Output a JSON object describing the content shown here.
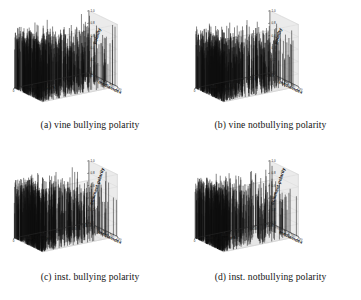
{
  "figure": {
    "panel_count": 4,
    "background": "#ffffff",
    "ink": "#111111"
  },
  "panels": [
    {
      "id": "a",
      "caption": "(a) vine bullying polarity",
      "xlabel": "hours",
      "ylabel": "mediaindex",
      "zlabel": "polarity",
      "xticks": [
        "0",
        "5000",
        "10000",
        "15000",
        "20000"
      ],
      "yticks": [
        "0",
        "25",
        "50",
        "75",
        "100"
      ],
      "zticks": [
        "0.0",
        "0.2",
        "0.4",
        "0.6",
        "0.8",
        "1.0"
      ]
    },
    {
      "id": "b",
      "caption": "(b) vine notbullying polarity",
      "xlabel": "hours",
      "ylabel": "mediaindex",
      "zlabel": "polarity",
      "xticks": [
        "0",
        "5000",
        "10000",
        "15000",
        "20000"
      ],
      "yticks": [
        "0",
        "25",
        "50",
        "75",
        "100"
      ],
      "zticks": [
        "0.0",
        "0.2",
        "0.4",
        "0.6",
        "0.8",
        "1.0"
      ]
    },
    {
      "id": "c",
      "caption": "(c) inst. bullying polarity",
      "xlabel": "hours",
      "ylabel": "mediaindex",
      "zlabel": "comment polarity",
      "xticks": [
        "0",
        "2000",
        "4000",
        "6000",
        "8000",
        "10000"
      ],
      "yticks": [
        "0",
        "25",
        "50",
        "75",
        "100"
      ],
      "zticks": [
        "0.0",
        "0.2",
        "0.4",
        "0.6",
        "0.8",
        "1.0"
      ]
    },
    {
      "id": "d",
      "caption": "(d) inst. notbullying polarity",
      "xlabel": "hours",
      "ylabel": "mediaindex",
      "zlabel": "comment polarity",
      "xticks": [
        "0",
        "2000",
        "4000",
        "6000",
        "8000",
        "10000"
      ],
      "yticks": [
        "0",
        "25",
        "50",
        "75",
        "100"
      ],
      "zticks": [
        "0.0",
        "0.2",
        "0.4",
        "0.6",
        "0.8",
        "1.0"
      ]
    }
  ],
  "chart_data": [
    {
      "type": "scatter",
      "subplot": "a",
      "title": "(a) vine bullying polarity",
      "xlabel": "hours",
      "ylabel": "mediaindex",
      "zlabel": "polarity",
      "xlim": [
        0,
        22000
      ],
      "ylim": [
        0,
        100
      ],
      "zlim": [
        0.0,
        1.0
      ],
      "grid": true,
      "legend": "none",
      "projection": "3d-stem",
      "description": "Dense vertical stems rising from the zero plane; heavy concentration of near-full-height spikes for hours 0-8000 across all mediaindex values, thinning out toward 20000 hours.",
      "points": [
        {
          "x": 200,
          "y": 8,
          "z": 0.92
        },
        {
          "x": 350,
          "y": 20,
          "z": 0.71
        },
        {
          "x": 500,
          "y": 45,
          "z": 0.98
        },
        {
          "x": 620,
          "y": 62,
          "z": 0.55
        },
        {
          "x": 780,
          "y": 12,
          "z": 0.83
        },
        {
          "x": 900,
          "y": 88,
          "z": 0.95
        },
        {
          "x": 1050,
          "y": 33,
          "z": 0.64
        },
        {
          "x": 1200,
          "y": 70,
          "z": 0.9
        },
        {
          "x": 1380,
          "y": 5,
          "z": 0.48
        },
        {
          "x": 1520,
          "y": 52,
          "z": 0.87
        },
        {
          "x": 1700,
          "y": 95,
          "z": 0.76
        },
        {
          "x": 1850,
          "y": 27,
          "z": 0.99
        },
        {
          "x": 2000,
          "y": 60,
          "z": 0.58
        },
        {
          "x": 2180,
          "y": 15,
          "z": 0.81
        },
        {
          "x": 2350,
          "y": 78,
          "z": 0.93
        },
        {
          "x": 2500,
          "y": 40,
          "z": 0.67
        },
        {
          "x": 2700,
          "y": 85,
          "z": 0.88
        },
        {
          "x": 2900,
          "y": 10,
          "z": 0.52
        },
        {
          "x": 3100,
          "y": 55,
          "z": 0.97
        },
        {
          "x": 3300,
          "y": 72,
          "z": 0.74
        },
        {
          "x": 3500,
          "y": 30,
          "z": 0.86
        },
        {
          "x": 3750,
          "y": 92,
          "z": 0.61
        },
        {
          "x": 4000,
          "y": 18,
          "z": 0.94
        },
        {
          "x": 4250,
          "y": 65,
          "z": 0.79
        },
        {
          "x": 4500,
          "y": 48,
          "z": 0.91
        },
        {
          "x": 4800,
          "y": 3,
          "z": 0.45
        },
        {
          "x": 5100,
          "y": 80,
          "z": 0.85
        },
        {
          "x": 5400,
          "y": 36,
          "z": 0.96
        },
        {
          "x": 5700,
          "y": 68,
          "z": 0.63
        },
        {
          "x": 6000,
          "y": 22,
          "z": 0.89
        },
        {
          "x": 6400,
          "y": 97,
          "z": 0.72
        },
        {
          "x": 6800,
          "y": 50,
          "z": 0.84
        },
        {
          "x": 7200,
          "y": 14,
          "z": 0.57
        },
        {
          "x": 7600,
          "y": 75,
          "z": 0.92
        },
        {
          "x": 8000,
          "y": 42,
          "z": 0.69
        },
        {
          "x": 8500,
          "y": 90,
          "z": 0.8
        },
        {
          "x": 9000,
          "y": 26,
          "z": 0.44
        },
        {
          "x": 9600,
          "y": 58,
          "z": 0.87
        },
        {
          "x": 10200,
          "y": 7,
          "z": 0.62
        },
        {
          "x": 10900,
          "y": 83,
          "z": 0.75
        },
        {
          "x": 11600,
          "y": 38,
          "z": 0.5
        },
        {
          "x": 12400,
          "y": 66,
          "z": 0.88
        },
        {
          "x": 13200,
          "y": 17,
          "z": 0.41
        },
        {
          "x": 14100,
          "y": 94,
          "z": 0.77
        },
        {
          "x": 15000,
          "y": 47,
          "z": 0.59
        },
        {
          "x": 16000,
          "y": 29,
          "z": 0.82
        },
        {
          "x": 17200,
          "y": 73,
          "z": 0.46
        },
        {
          "x": 18500,
          "y": 11,
          "z": 0.7
        },
        {
          "x": 19800,
          "y": 56,
          "z": 0.53
        },
        {
          "x": 21000,
          "y": 86,
          "z": 0.38
        }
      ]
    },
    {
      "type": "scatter",
      "subplot": "b",
      "title": "(b) vine notbullying polarity",
      "xlabel": "hours",
      "ylabel": "mediaindex",
      "zlabel": "polarity",
      "xlim": [
        0,
        22000
      ],
      "ylim": [
        0,
        100
      ],
      "zlim": [
        0.0,
        1.0
      ],
      "grid": true,
      "legend": "none",
      "projection": "3d-stem",
      "description": "Dense vertical stems with the darkest cluster between 1000 and 9000 hours; sparser but still tall spikes continuing to 20000 hours.",
      "points": [
        {
          "x": 150,
          "y": 6,
          "z": 0.66
        },
        {
          "x": 320,
          "y": 30,
          "z": 0.94
        },
        {
          "x": 480,
          "y": 58,
          "z": 0.79
        },
        {
          "x": 650,
          "y": 12,
          "z": 0.88
        },
        {
          "x": 820,
          "y": 74,
          "z": 0.55
        },
        {
          "x": 1000,
          "y": 41,
          "z": 0.97
        },
        {
          "x": 1200,
          "y": 90,
          "z": 0.71
        },
        {
          "x": 1400,
          "y": 22,
          "z": 0.85
        },
        {
          "x": 1600,
          "y": 63,
          "z": 0.6
        },
        {
          "x": 1820,
          "y": 4,
          "z": 0.92
        },
        {
          "x": 2050,
          "y": 47,
          "z": 0.77
        },
        {
          "x": 2300,
          "y": 81,
          "z": 0.99
        },
        {
          "x": 2550,
          "y": 18,
          "z": 0.53
        },
        {
          "x": 2800,
          "y": 69,
          "z": 0.86
        },
        {
          "x": 3050,
          "y": 35,
          "z": 0.73
        },
        {
          "x": 3300,
          "y": 96,
          "z": 0.91
        },
        {
          "x": 3600,
          "y": 9,
          "z": 0.64
        },
        {
          "x": 3900,
          "y": 54,
          "z": 0.83
        },
        {
          "x": 4200,
          "y": 77,
          "z": 0.58
        },
        {
          "x": 4550,
          "y": 26,
          "z": 0.95
        },
        {
          "x": 4900,
          "y": 62,
          "z": 0.7
        },
        {
          "x": 5250,
          "y": 44,
          "z": 0.89
        },
        {
          "x": 5600,
          "y": 87,
          "z": 0.51
        },
        {
          "x": 6000,
          "y": 15,
          "z": 0.8
        },
        {
          "x": 6400,
          "y": 71,
          "z": 0.93
        },
        {
          "x": 6850,
          "y": 38,
          "z": 0.67
        },
        {
          "x": 7300,
          "y": 93,
          "z": 0.84
        },
        {
          "x": 7800,
          "y": 2,
          "z": 0.49
        },
        {
          "x": 8300,
          "y": 50,
          "z": 0.9
        },
        {
          "x": 8900,
          "y": 66,
          "z": 0.62
        },
        {
          "x": 9500,
          "y": 24,
          "z": 0.87
        },
        {
          "x": 10200,
          "y": 79,
          "z": 0.56
        },
        {
          "x": 10900,
          "y": 43,
          "z": 0.76
        },
        {
          "x": 11700,
          "y": 98,
          "z": 0.68
        },
        {
          "x": 12500,
          "y": 13,
          "z": 0.82
        },
        {
          "x": 13400,
          "y": 59,
          "z": 0.47
        },
        {
          "x": 14300,
          "y": 84,
          "z": 0.74
        },
        {
          "x": 15300,
          "y": 32,
          "z": 0.61
        },
        {
          "x": 16400,
          "y": 67,
          "z": 0.88
        },
        {
          "x": 17500,
          "y": 20,
          "z": 0.43
        },
        {
          "x": 18700,
          "y": 52,
          "z": 0.72
        },
        {
          "x": 20000,
          "y": 89,
          "z": 0.57
        },
        {
          "x": 21200,
          "y": 37,
          "z": 0.4
        }
      ]
    },
    {
      "type": "scatter",
      "subplot": "c",
      "title": "(c) inst. bullying polarity",
      "xlabel": "hours",
      "ylabel": "mediaindex",
      "zlabel": "comment polarity",
      "xlim": [
        0,
        11000
      ],
      "ylim": [
        0,
        100
      ],
      "zlim": [
        0.0,
        1.0
      ],
      "grid": true,
      "legend": "none",
      "projection": "3d-stem",
      "description": "Very dense black band of stems for hours 0-3500 spanning all mediaindex values; progressively sparser isolated spikes out to 10000 hours.",
      "points": [
        {
          "x": 80,
          "y": 5,
          "z": 0.95
        },
        {
          "x": 160,
          "y": 28,
          "z": 0.73
        },
        {
          "x": 240,
          "y": 52,
          "z": 0.99
        },
        {
          "x": 330,
          "y": 76,
          "z": 0.61
        },
        {
          "x": 420,
          "y": 14,
          "z": 0.88
        },
        {
          "x": 510,
          "y": 91,
          "z": 0.8
        },
        {
          "x": 610,
          "y": 37,
          "z": 0.94
        },
        {
          "x": 700,
          "y": 64,
          "z": 0.56
        },
        {
          "x": 800,
          "y": 8,
          "z": 0.91
        },
        {
          "x": 900,
          "y": 45,
          "z": 0.77
        },
        {
          "x": 1010,
          "y": 83,
          "z": 0.97
        },
        {
          "x": 1120,
          "y": 20,
          "z": 0.68
        },
        {
          "x": 1240,
          "y": 58,
          "z": 0.85
        },
        {
          "x": 1360,
          "y": 96,
          "z": 0.92
        },
        {
          "x": 1480,
          "y": 32,
          "z": 0.59
        },
        {
          "x": 1610,
          "y": 70,
          "z": 0.86
        },
        {
          "x": 1740,
          "y": 11,
          "z": 0.98
        },
        {
          "x": 1880,
          "y": 48,
          "z": 0.64
        },
        {
          "x": 2020,
          "y": 87,
          "z": 0.89
        },
        {
          "x": 2170,
          "y": 25,
          "z": 0.75
        },
        {
          "x": 2320,
          "y": 61,
          "z": 0.93
        },
        {
          "x": 2480,
          "y": 40,
          "z": 0.52
        },
        {
          "x": 2650,
          "y": 79,
          "z": 0.84
        },
        {
          "x": 2820,
          "y": 17,
          "z": 0.96
        },
        {
          "x": 3000,
          "y": 55,
          "z": 0.7
        },
        {
          "x": 3200,
          "y": 93,
          "z": 0.82
        },
        {
          "x": 3400,
          "y": 34,
          "z": 0.58
        },
        {
          "x": 3650,
          "y": 67,
          "z": 0.9
        },
        {
          "x": 3900,
          "y": 3,
          "z": 0.46
        },
        {
          "x": 4200,
          "y": 50,
          "z": 0.87
        },
        {
          "x": 4500,
          "y": 85,
          "z": 0.63
        },
        {
          "x": 4850,
          "y": 22,
          "z": 0.79
        },
        {
          "x": 5200,
          "y": 72,
          "z": 0.91
        },
        {
          "x": 5600,
          "y": 43,
          "z": 0.54
        },
        {
          "x": 6000,
          "y": 98,
          "z": 0.76
        },
        {
          "x": 6450,
          "y": 16,
          "z": 0.83
        },
        {
          "x": 6900,
          "y": 60,
          "z": 0.48
        },
        {
          "x": 7400,
          "y": 88,
          "z": 0.71
        },
        {
          "x": 7900,
          "y": 30,
          "z": 0.65
        },
        {
          "x": 8450,
          "y": 74,
          "z": 0.88
        },
        {
          "x": 9000,
          "y": 9,
          "z": 0.42
        },
        {
          "x": 9600,
          "y": 53,
          "z": 0.69
        },
        {
          "x": 10200,
          "y": 81,
          "z": 0.55
        },
        {
          "x": 10800,
          "y": 38,
          "z": 0.36
        }
      ]
    },
    {
      "type": "scatter",
      "subplot": "d",
      "title": "(d) inst. notbullying polarity",
      "xlabel": "hours",
      "ylabel": "mediaindex",
      "zlabel": "comment polarity",
      "xlim": [
        0,
        11000
      ],
      "ylim": [
        0,
        100
      ],
      "zlim": [
        0.0,
        1.0
      ],
      "grid": true,
      "legend": "none",
      "projection": "3d-stem",
      "description": "Dense stems concentrated at low hours with a solid dark wedge around 1000-4000 hours; moderate spikes continuing across the remaining range.",
      "points": [
        {
          "x": 90,
          "y": 7,
          "z": 0.84
        },
        {
          "x": 180,
          "y": 34,
          "z": 0.96
        },
        {
          "x": 270,
          "y": 60,
          "z": 0.67
        },
        {
          "x": 370,
          "y": 88,
          "z": 0.9
        },
        {
          "x": 470,
          "y": 19,
          "z": 0.75
        },
        {
          "x": 580,
          "y": 46,
          "z": 0.98
        },
        {
          "x": 690,
          "y": 73,
          "z": 0.58
        },
        {
          "x": 810,
          "y": 2,
          "z": 0.87
        },
        {
          "x": 930,
          "y": 54,
          "z": 0.93
        },
        {
          "x": 1060,
          "y": 80,
          "z": 0.62
        },
        {
          "x": 1190,
          "y": 27,
          "z": 0.95
        },
        {
          "x": 1330,
          "y": 66,
          "z": 0.79
        },
        {
          "x": 1470,
          "y": 13,
          "z": 0.89
        },
        {
          "x": 1620,
          "y": 94,
          "z": 0.71
        },
        {
          "x": 1780,
          "y": 41,
          "z": 0.97
        },
        {
          "x": 1940,
          "y": 69,
          "z": 0.53
        },
        {
          "x": 2100,
          "y": 24,
          "z": 0.85
        },
        {
          "x": 2280,
          "y": 57,
          "z": 0.92
        },
        {
          "x": 2460,
          "y": 97,
          "z": 0.66
        },
        {
          "x": 2650,
          "y": 36,
          "z": 0.81
        },
        {
          "x": 2850,
          "y": 77,
          "z": 0.94
        },
        {
          "x": 3050,
          "y": 10,
          "z": 0.6
        },
        {
          "x": 3280,
          "y": 49,
          "z": 0.88
        },
        {
          "x": 3500,
          "y": 86,
          "z": 0.74
        },
        {
          "x": 3750,
          "y": 30,
          "z": 0.91
        },
        {
          "x": 4000,
          "y": 63,
          "z": 0.57
        },
        {
          "x": 4300,
          "y": 5,
          "z": 0.83
        },
        {
          "x": 4600,
          "y": 51,
          "z": 0.7
        },
        {
          "x": 4950,
          "y": 90,
          "z": 0.86
        },
        {
          "x": 5300,
          "y": 21,
          "z": 0.5
        },
        {
          "x": 5700,
          "y": 68,
          "z": 0.78
        },
        {
          "x": 6100,
          "y": 44,
          "z": 0.93
        },
        {
          "x": 6550,
          "y": 99,
          "z": 0.64
        },
        {
          "x": 7000,
          "y": 15,
          "z": 0.82
        },
        {
          "x": 7500,
          "y": 58,
          "z": 0.47
        },
        {
          "x": 8000,
          "y": 82,
          "z": 0.76
        },
        {
          "x": 8550,
          "y": 33,
          "z": 0.68
        },
        {
          "x": 9100,
          "y": 71,
          "z": 0.89
        },
        {
          "x": 9700,
          "y": 12,
          "z": 0.44
        },
        {
          "x": 10300,
          "y": 48,
          "z": 0.73
        },
        {
          "x": 10850,
          "y": 92,
          "z": 0.39
        }
      ]
    }
  ]
}
